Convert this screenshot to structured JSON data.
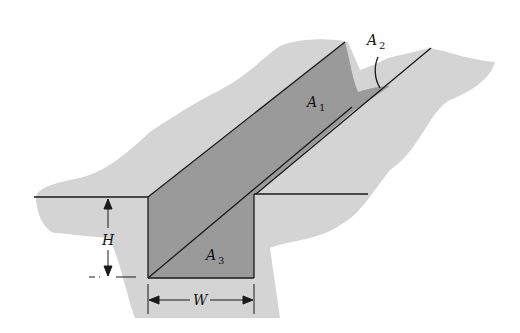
{
  "diagram": {
    "type": "trench-cross-section",
    "colors": {
      "background": "#ffffff",
      "ground": "#d4d4d4",
      "trench_wall": "#9a9a9a",
      "line": "#1a1a1a"
    },
    "labels": {
      "a1": {
        "main": "A",
        "sub": "1"
      },
      "a2": {
        "main": "A",
        "sub": "2"
      },
      "a3": {
        "main": "A",
        "sub": "3"
      },
      "height": "H",
      "width": "W"
    }
  }
}
